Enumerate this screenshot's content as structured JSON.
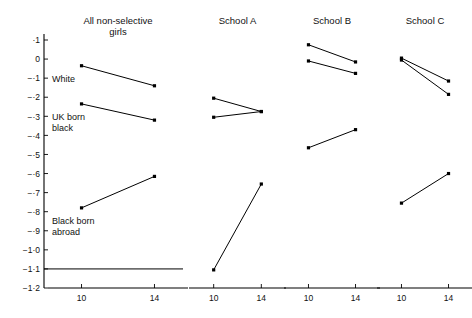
{
  "chart_data": {
    "type": "line",
    "title": "",
    "subtitle": "",
    "xlabel": "",
    "ylabel": "",
    "xlim": [
      8.6,
      15.4
    ],
    "ylim": [
      -1.2,
      0.1
    ],
    "grid": false,
    "legend_position": "inline-annotations",
    "x": [
      10,
      14
    ],
    "x_tick_labels": [
      "10",
      "14"
    ],
    "y_tick_values": [
      0.1,
      0,
      -0.1,
      -0.2,
      -0.3,
      -0.4,
      -0.5,
      -0.6,
      -0.7,
      -0.8,
      -0.9,
      -1.0,
      -1.1,
      -1.2
    ],
    "y_tick_labels": [
      "·1",
      "0",
      "−·1",
      "−·2",
      "−·3",
      "−·4",
      "−·5",
      "−·6",
      "−·7",
      "−·8",
      "−·9",
      "−1·0",
      "−1·1",
      "−1·2"
    ],
    "panels": [
      {
        "name": "all-non-selective-girls",
        "title_line1": "All non-selective",
        "title_line2": "girls",
        "reference_line": {
          "label": "",
          "y": -1.1
        },
        "series": [
          {
            "name": "White",
            "annotation": "White",
            "annotation_lines": [
              "White"
            ],
            "values": [
              -0.035,
              -0.14
            ]
          },
          {
            "name": "UK born black",
            "annotation": "UK born black",
            "annotation_lines": [
              "UK born",
              "black"
            ],
            "values": [
              -0.235,
              -0.32
            ]
          },
          {
            "name": "Black born abroad",
            "annotation": "Black born abroad",
            "annotation_lines": [
              "Black born",
              "abroad"
            ],
            "values": [
              -0.78,
              -0.615
            ]
          }
        ]
      },
      {
        "name": "school-a",
        "title_line1": "School A",
        "title_line2": "",
        "reference_line": null,
        "series": [
          {
            "name": "White",
            "annotation": "",
            "annotation_lines": [],
            "values": [
              -0.205,
              -0.275
            ]
          },
          {
            "name": "UK born black",
            "annotation": "",
            "annotation_lines": [],
            "values": [
              -0.305,
              -0.275
            ]
          },
          {
            "name": "Black born abroad",
            "annotation": "",
            "annotation_lines": [],
            "values": [
              -1.105,
              -0.655
            ]
          }
        ]
      },
      {
        "name": "school-b",
        "title_line1": "School B",
        "title_line2": "",
        "reference_line": null,
        "series": [
          {
            "name": "White",
            "annotation": "",
            "annotation_lines": [],
            "values": [
              0.075,
              -0.015
            ]
          },
          {
            "name": "UK born black",
            "annotation": "",
            "annotation_lines": [],
            "values": [
              -0.01,
              -0.075
            ]
          },
          {
            "name": "Black born abroad",
            "annotation": "",
            "annotation_lines": [],
            "values": [
              -0.465,
              -0.37
            ]
          }
        ]
      },
      {
        "name": "school-c",
        "title_line1": "School C",
        "title_line2": "",
        "reference_line": null,
        "series": [
          {
            "name": "White",
            "annotation": "",
            "annotation_lines": [],
            "values": [
              0.005,
              -0.115
            ]
          },
          {
            "name": "UK born black",
            "annotation": "",
            "annotation_lines": [],
            "values": [
              -0.005,
              -0.185
            ]
          },
          {
            "name": "Black born abroad",
            "annotation": "",
            "annotation_lines": [],
            "values": [
              -0.755,
              -0.6
            ]
          }
        ]
      }
    ]
  },
  "colors": {
    "line": "#000000",
    "marker": "#000000",
    "axis": "#000000",
    "text": "#111111",
    "background": "#ffffff"
  }
}
